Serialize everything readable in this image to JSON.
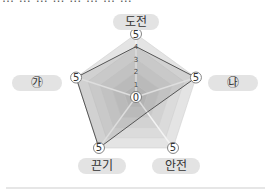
{
  "header_fragment": "… … … … … … … …",
  "chart_data": {
    "type": "radar",
    "title": "",
    "axes": [
      "도전",
      "㉯",
      "안전",
      "끈기",
      "㉮"
    ],
    "scale": {
      "min": 0,
      "max": 5,
      "ticks": [
        0,
        1,
        2,
        3,
        4,
        5
      ]
    },
    "vertex_labels": [
      "5",
      "5",
      "5",
      "5",
      "5"
    ],
    "center_label": "0",
    "series": [
      {
        "name": "profile",
        "values": [
          4,
          5,
          1.5,
          5,
          5
        ],
        "color": "#555555"
      }
    ],
    "grid": true,
    "fill_colors": [
      "#b9b9b9",
      "#e3e3e3"
    ]
  },
  "labels": {
    "top": "도전",
    "right": "㉯",
    "bottom_right": "안전",
    "bottom_left": "끈기",
    "left": "㉮"
  }
}
